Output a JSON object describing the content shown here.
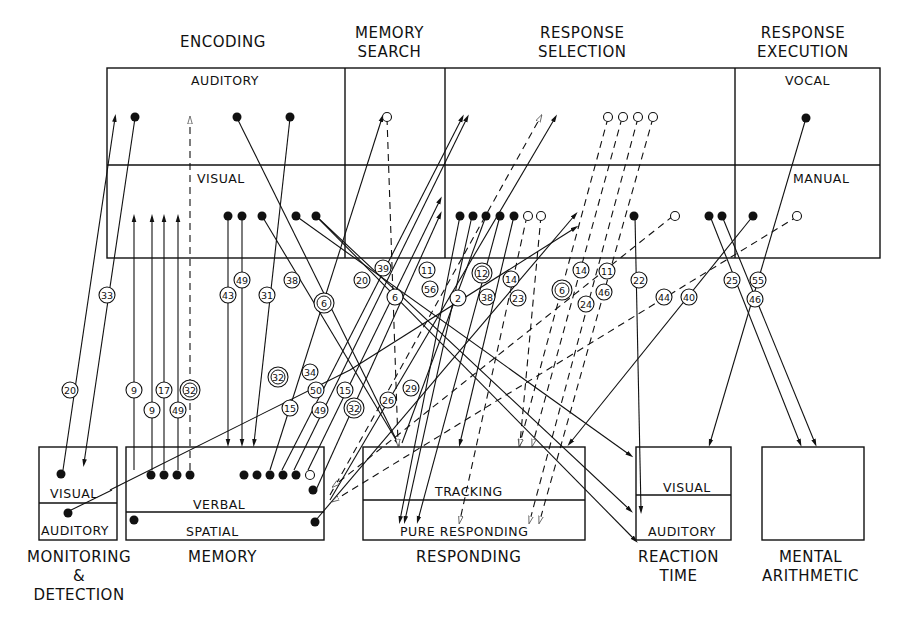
{
  "stages": {
    "encoding": "ENCODING",
    "memory_search_1": "MEMORY",
    "memory_search_2": "SEARCH",
    "response_selection_1": "RESPONSE",
    "response_selection_2": "SELECTION",
    "response_execution_1": "RESPONSE",
    "response_execution_2": "EXECUTION"
  },
  "top_rows": {
    "auditory": "AUDITORY",
    "visual": "VISUAL",
    "vocal": "VOCAL",
    "manual": "MANUAL"
  },
  "tasks": {
    "monitoring": {
      "visual": "VISUAL",
      "auditory": "AUDITORY",
      "title_1": "MONITORING",
      "title_2": "&",
      "title_3": "DETECTION"
    },
    "memory": {
      "verbal": "VERBAL",
      "spatial": "SPATIAL",
      "title": "MEMORY"
    },
    "responding": {
      "tracking": "TRACKING",
      "pure": "PURE RESPONDING",
      "title": "RESPONDING"
    },
    "reaction_time": {
      "visual": "VISUAL",
      "auditory": "AUDITORY",
      "title_1": "REACTION",
      "title_2": "TIME"
    },
    "mental_arithmetic": {
      "title_1": "MENTAL",
      "title_2": "ARITHMETIC"
    }
  },
  "study_labels": [
    {
      "n": "33",
      "x": 107,
      "y": 295,
      "double": false
    },
    {
      "n": "20",
      "x": 70,
      "y": 390,
      "double": false
    },
    {
      "n": "9",
      "x": 134,
      "y": 390,
      "double": false
    },
    {
      "n": "9",
      "x": 152,
      "y": 410,
      "double": false
    },
    {
      "n": "17",
      "x": 164,
      "y": 390,
      "double": false
    },
    {
      "n": "49",
      "x": 178,
      "y": 410,
      "double": false
    },
    {
      "n": "32",
      "x": 190,
      "y": 390,
      "double": true
    },
    {
      "n": "43",
      "x": 228,
      "y": 295,
      "double": false
    },
    {
      "n": "49",
      "x": 242,
      "y": 280,
      "double": false
    },
    {
      "n": "31",
      "x": 267,
      "y": 295,
      "double": false
    },
    {
      "n": "38",
      "x": 292,
      "y": 280,
      "double": false
    },
    {
      "n": "6",
      "x": 324,
      "y": 303,
      "double": true
    },
    {
      "n": "32",
      "x": 278,
      "y": 377,
      "double": true
    },
    {
      "n": "34",
      "x": 310,
      "y": 372,
      "double": false
    },
    {
      "n": "50",
      "x": 316,
      "y": 390,
      "double": false
    },
    {
      "n": "15",
      "x": 290,
      "y": 408,
      "double": false
    },
    {
      "n": "49",
      "x": 320,
      "y": 410,
      "double": false
    },
    {
      "n": "15",
      "x": 345,
      "y": 390,
      "double": false
    },
    {
      "n": "32",
      "x": 354,
      "y": 408,
      "double": true
    },
    {
      "n": "26",
      "x": 388,
      "y": 400,
      "double": false
    },
    {
      "n": "29",
      "x": 411,
      "y": 388,
      "double": false
    },
    {
      "n": "20",
      "x": 362,
      "y": 280,
      "double": false
    },
    {
      "n": "39",
      "x": 383,
      "y": 268,
      "double": false
    },
    {
      "n": "6",
      "x": 395,
      "y": 297,
      "double": false
    },
    {
      "n": "11",
      "x": 427,
      "y": 270,
      "double": false
    },
    {
      "n": "56",
      "x": 430,
      "y": 289,
      "double": false
    },
    {
      "n": "2",
      "x": 458,
      "y": 298,
      "double": false
    },
    {
      "n": "12",
      "x": 482,
      "y": 273,
      "double": true
    },
    {
      "n": "38",
      "x": 487,
      "y": 297,
      "double": false
    },
    {
      "n": "14",
      "x": 511,
      "y": 279,
      "double": false
    },
    {
      "n": "23",
      "x": 518,
      "y": 298,
      "double": false
    },
    {
      "n": "6",
      "x": 562,
      "y": 290,
      "double": true
    },
    {
      "n": "14",
      "x": 581,
      "y": 270,
      "double": false
    },
    {
      "n": "11",
      "x": 607,
      "y": 271,
      "double": false
    },
    {
      "n": "24",
      "x": 586,
      "y": 304,
      "double": false
    },
    {
      "n": "46",
      "x": 604,
      "y": 292,
      "double": false
    },
    {
      "n": "22",
      "x": 639,
      "y": 280,
      "double": false
    },
    {
      "n": "44",
      "x": 664,
      "y": 297,
      "double": false
    },
    {
      "n": "40",
      "x": 689,
      "y": 297,
      "double": false
    },
    {
      "n": "25",
      "x": 732,
      "y": 280,
      "double": false
    },
    {
      "n": "55",
      "x": 758,
      "y": 280,
      "double": false
    },
    {
      "n": "46",
      "x": 755,
      "y": 299,
      "double": false
    }
  ],
  "colors": {
    "ink": "#111111",
    "paper": "#ffffff"
  }
}
